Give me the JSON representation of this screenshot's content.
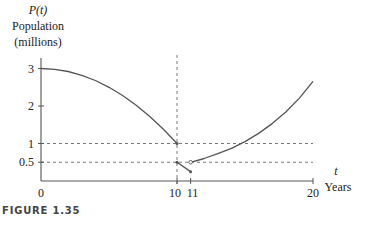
{
  "figure_caption": "FIGURE 1.35",
  "chart_data": {
    "type": "line",
    "title": "",
    "ylabel_symbol": "P(t)",
    "ylabel_lines": [
      "Population",
      "(millions)"
    ],
    "xlabel_symbol": "t",
    "xlabel": "Years",
    "xlim": [
      0,
      20
    ],
    "ylim": [
      0,
      3.3
    ],
    "x_ticks": [
      0,
      10,
      11,
      20
    ],
    "x_tick_labels": [
      "0",
      "10",
      "11",
      "20"
    ],
    "y_ticks": [
      0.5,
      1,
      2,
      3
    ],
    "y_tick_labels": [
      "0.5",
      "1",
      "2",
      "3"
    ],
    "reference_lines": {
      "vertical": [
        10
      ],
      "horizontal": [
        1,
        0.5
      ]
    },
    "series": [
      {
        "name": "segment-1",
        "x": [
          0,
          1,
          2,
          3,
          4,
          5,
          6,
          7,
          8,
          9,
          10
        ],
        "y": [
          3.0,
          2.98,
          2.92,
          2.82,
          2.68,
          2.5,
          2.28,
          2.02,
          1.72,
          1.38,
          1.0
        ],
        "end_marker": "closed"
      },
      {
        "name": "segment-2",
        "x": [
          10,
          11
        ],
        "y": [
          0.5,
          0.25
        ],
        "start_marker": "closed",
        "end_marker": "closed"
      },
      {
        "name": "segment-3",
        "x": [
          11,
          12,
          13,
          14,
          15,
          16,
          17,
          18,
          19,
          20
        ],
        "y": [
          0.5,
          0.6,
          0.73,
          0.87,
          1.05,
          1.27,
          1.53,
          1.84,
          2.21,
          2.66
        ],
        "start_marker": "open"
      }
    ]
  }
}
